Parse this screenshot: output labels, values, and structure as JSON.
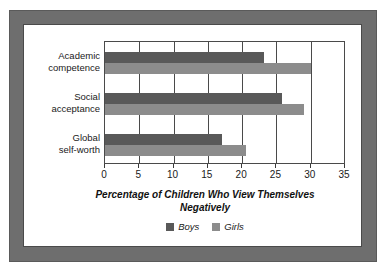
{
  "chart_data": {
    "type": "bar",
    "orientation": "horizontal",
    "title": "",
    "xlabel": "Percentage of Children Who View Themselves Negatively",
    "ylabel": "",
    "xlim": [
      0,
      35
    ],
    "xticks": [
      0,
      5,
      10,
      15,
      20,
      25,
      30,
      35
    ],
    "xtick_labels": [
      "0",
      "5",
      "10",
      "15",
      "20",
      "25",
      "30",
      "35"
    ],
    "grid": true,
    "grid_axis": "x",
    "legend_position": "bottom",
    "categories": [
      "Academic competence",
      "Social acceptance",
      "Global self-worth"
    ],
    "category_lines": [
      [
        "Academic",
        "competence"
      ],
      [
        "Social",
        "acceptance"
      ],
      [
        "Global",
        "self-worth"
      ]
    ],
    "series": [
      {
        "name": "Boys",
        "color": "#595959",
        "values": [
          23.2,
          25.8,
          17.0
        ]
      },
      {
        "name": "Girls",
        "color": "#8c8c8c",
        "values": [
          30.0,
          29.0,
          20.5
        ]
      }
    ]
  },
  "axis_title": {
    "line1": "Percentage of Children Who View Themselves",
    "line2": "Negatively"
  },
  "legend": {
    "items": [
      {
        "label": "Boys",
        "color": "#595959"
      },
      {
        "label": "Girls",
        "color": "#8c8c8c"
      }
    ]
  },
  "colors": {
    "frame": "#6e6e6e",
    "frame_border": "#5a5a5a",
    "plot_border": "#4a4a4a",
    "background": "#ffffff",
    "boys": "#595959",
    "girls": "#8c8c8c",
    "text": "#1a1a1a"
  }
}
